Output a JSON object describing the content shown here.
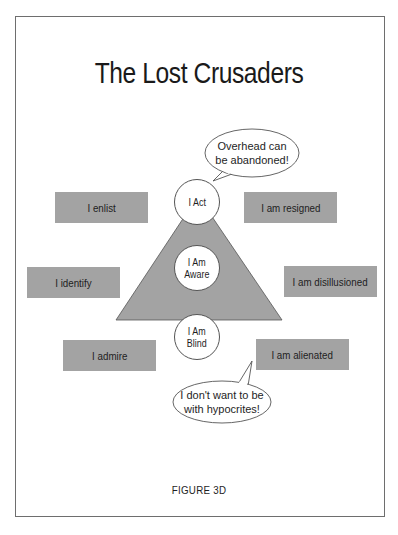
{
  "title": "The Lost Crusaders",
  "caption": "FIGURE 3D",
  "pyramid": {
    "fill": "#a3a3a3",
    "circles": [
      {
        "id": "act",
        "label": "I Act"
      },
      {
        "id": "aware",
        "label": "I Am\nAware"
      },
      {
        "id": "blind",
        "label": "I Am\nBlind"
      }
    ]
  },
  "left_boxes": [
    {
      "label": "I enlist"
    },
    {
      "label": "I identify"
    },
    {
      "label": "I admire"
    }
  ],
  "right_boxes": [
    {
      "label": "I am resigned"
    },
    {
      "label": "I am disillusioned"
    },
    {
      "label": "I am alienated"
    }
  ],
  "speech_bubbles": [
    {
      "id": "top",
      "text": "Overhead can\nbe abandoned!"
    },
    {
      "id": "bottom",
      "text": "I don't want to be\nwith hypocrites!"
    }
  ]
}
